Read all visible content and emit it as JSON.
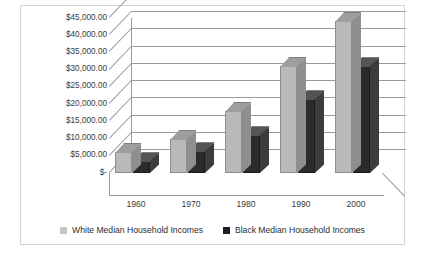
{
  "chart_data": {
    "type": "bar",
    "title": "",
    "xlabel": "",
    "ylabel": "",
    "categories": [
      "1960",
      "1970",
      "1980",
      "1990",
      "2000"
    ],
    "series": [
      {
        "name": "White Median Household Incomes",
        "color": "#b9b9b9",
        "values": [
          6000,
          10000,
          18000,
          31000,
          44000
        ]
      },
      {
        "name": "Black Median Household Incomes",
        "color": "#2b2b2b",
        "values": [
          3500,
          6300,
          11000,
          21500,
          31000
        ]
      }
    ],
    "ylim": [
      0,
      45000
    ],
    "ytick_labels": [
      "$45,000.00",
      "$40,000.00",
      "$35,000.00",
      "$30,000.00",
      "$25,000.00",
      "$20,000.00",
      "$15,000.00",
      "$10,000.00",
      "$5,000.00",
      "$-"
    ],
    "ytick_values": [
      45000,
      40000,
      35000,
      30000,
      25000,
      20000,
      15000,
      10000,
      5000,
      0
    ],
    "grid": true,
    "legend_position": "bottom",
    "three_d": true
  },
  "legend": {
    "items": [
      {
        "label": "White Median Household Incomes",
        "swatch": "light-gray-square"
      },
      {
        "label": "Black Median Household Incomes",
        "swatch": "black-square"
      }
    ]
  }
}
